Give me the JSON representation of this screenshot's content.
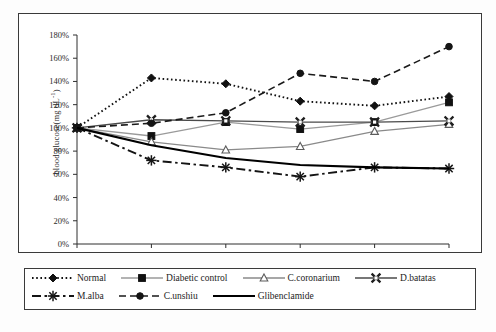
{
  "figure": {
    "y_axis_title": "blood glucose(mg dL",
    "y_axis_title_sup": "-1",
    "y_axis_title_tail": ")",
    "x_axis_unit_label": "hours"
  },
  "chart_data": {
    "type": "line",
    "title": "",
    "xlabel": "hours",
    "ylabel": "blood glucose(mg dL-1)",
    "categories": [
      "0h",
      "1h",
      "3h",
      "5h",
      "7h",
      "9h"
    ],
    "x_tick_labels": [
      "0h",
      "1h",
      "3h",
      "5h",
      "7h",
      "9h"
    ],
    "y_tick_labels": [
      "0%",
      "20%",
      "40%",
      "60%",
      "80%",
      "100%",
      "120%",
      "140%",
      "160%",
      "180%"
    ],
    "y_tick_values": [
      0,
      20,
      40,
      60,
      80,
      100,
      120,
      140,
      160,
      180
    ],
    "ylim": [
      0,
      180
    ],
    "grid": false,
    "legend_position": "bottom",
    "series": [
      {
        "name": "Normal",
        "values": [
          100,
          143,
          138,
          123,
          119,
          127
        ],
        "marker": "diamond-filled",
        "line_style": "dotted",
        "color": "#111111"
      },
      {
        "name": "Diabetic control",
        "values": [
          100,
          93,
          105,
          99,
          105,
          122
        ],
        "marker": "square-filled",
        "line_style": "solid",
        "color": "#9a9a9a"
      },
      {
        "name": "C.coronarium",
        "values": [
          100,
          88,
          81,
          84,
          97,
          103
        ],
        "marker": "triangle-open",
        "line_style": "solid",
        "color": "#8a8a8a"
      },
      {
        "name": "D.batatas",
        "values": [
          100,
          107,
          106,
          105,
          105,
          106
        ],
        "marker": "x-cross",
        "line_style": "solid",
        "color": "#4a4a4a"
      },
      {
        "name": "M.alba",
        "values": [
          100,
          72,
          66,
          58,
          66,
          65
        ],
        "marker": "asterisk",
        "line_style": "dash-dot",
        "color": "#141414"
      },
      {
        "name": "C.unshiu",
        "values": [
          100,
          104,
          113,
          147,
          140,
          170
        ],
        "marker": "circle-filled",
        "line_style": "dashed",
        "color": "#1a1a1a"
      },
      {
        "name": "Glibenclamide",
        "values": [
          100,
          85,
          74,
          68,
          66,
          65
        ],
        "marker": "none",
        "line_style": "solid-thick",
        "color": "#000000"
      }
    ]
  },
  "legend": {
    "rows": [
      [
        {
          "label": "Normal",
          "key": "normal"
        },
        {
          "label": "Diabetic control",
          "key": "diabetic-control"
        },
        {
          "label": "C.coronarium",
          "key": "c-coronarium"
        },
        {
          "label": "D.batatas",
          "key": "d-batatas"
        }
      ],
      [
        {
          "label": "M.alba",
          "key": "m-alba"
        },
        {
          "label": "C.unshiu",
          "key": "c-unshiu"
        },
        {
          "label": "Glibenclamide",
          "key": "glibenclamide"
        }
      ]
    ]
  }
}
